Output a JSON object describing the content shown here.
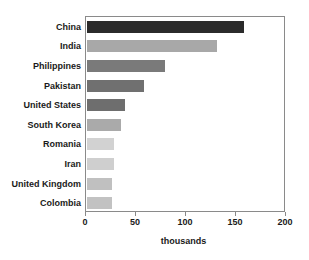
{
  "chart_data": {
    "type": "bar",
    "orientation": "horizontal",
    "title": "",
    "xlabel": "thousands",
    "ylabel": "",
    "xlim": [
      0,
      200
    ],
    "xticks": [
      0,
      50,
      100,
      150,
      200
    ],
    "xtick_labels": [
      "0",
      "50",
      "100",
      "150",
      "200"
    ],
    "grid": false,
    "legend": false,
    "categories": [
      "China",
      "India",
      "Philippines",
      "Pakistan",
      "United States",
      "South Korea",
      "Romania",
      "Iran",
      "United Kingdom",
      "Colombia"
    ],
    "values": [
      157,
      130,
      78,
      57,
      38,
      34,
      27,
      27,
      25,
      25
    ],
    "bar_colors": [
      "#2b2b2b",
      "#a8a8a8",
      "#7a7a7a",
      "#707070",
      "#6e6e6e",
      "#aaaaaa",
      "#d2d2d2",
      "#cfcfcf",
      "#c0c0c0",
      "#c2c2c2"
    ]
  },
  "style": {
    "axis_color": "#8a8a8a",
    "text_color": "#1a1a1a",
    "background": "#ffffff"
  }
}
